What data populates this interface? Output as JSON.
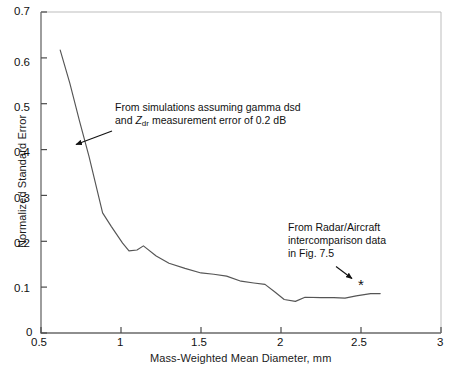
{
  "chart_data": {
    "type": "line",
    "title": "",
    "xlabel": "Mass-Weighted Mean Diameter, mm",
    "ylabel": "Normalized Standard Error",
    "xlim": [
      0.5,
      3
    ],
    "ylim": [
      0,
      0.7
    ],
    "grid": false,
    "legend": "none",
    "xticks": [
      "0.5",
      "1",
      "1.5",
      "2",
      "2.5",
      "3"
    ],
    "xtick_values": [
      0.5,
      1,
      1.5,
      2,
      2.5,
      3
    ],
    "yticks": [
      "0",
      "0.1",
      "0.2",
      "0.3",
      "0.4",
      "0.5",
      "0.6",
      "0.7"
    ],
    "ytick_values": [
      0,
      0.1,
      0.2,
      0.3,
      0.4,
      0.5,
      0.6,
      0.7
    ],
    "series": [
      {
        "name": "Simulated normalized standard error",
        "style": "line",
        "x": [
          0.62,
          0.68,
          0.74,
          0.8,
          0.885,
          0.94,
          1.01,
          1.05,
          1.1,
          1.14,
          1.22,
          1.3,
          1.4,
          1.5,
          1.58,
          1.66,
          1.75,
          1.83,
          1.9,
          1.96,
          2.02,
          2.09,
          2.15,
          2.25,
          2.33,
          2.4,
          2.47,
          2.56,
          2.62
        ],
        "y": [
          0.617,
          0.545,
          0.463,
          0.385,
          0.262,
          0.232,
          0.196,
          0.179,
          0.181,
          0.19,
          0.168,
          0.152,
          0.141,
          0.131,
          0.128,
          0.124,
          0.113,
          0.109,
          0.106,
          0.09,
          0.073,
          0.069,
          0.078,
          0.077,
          0.077,
          0.076,
          0.081,
          0.086,
          0.086
        ]
      },
      {
        "name": "Radar/Aircraft intercomparison point",
        "style": "marker",
        "marker": "asterisk",
        "x": [
          2.5
        ],
        "y": [
          0.105
        ]
      }
    ],
    "annotations": [
      {
        "id": "simulation-note",
        "line1": "From simulations assuming gamma dsd",
        "line2_prefix": "and ",
        "line2_symbol": "Z",
        "line2_subscript": "dr",
        "line2_suffix": " measurement error of 0.2 dB",
        "arrow_to": [
          0.705,
          0.43
        ]
      },
      {
        "id": "radar-aircraft-note",
        "line1": "From Radar/Aircraft",
        "line2": "intercomparison data",
        "line3": "in Fig. 7.5",
        "arrow_to": [
          2.45,
          0.122
        ]
      }
    ]
  }
}
